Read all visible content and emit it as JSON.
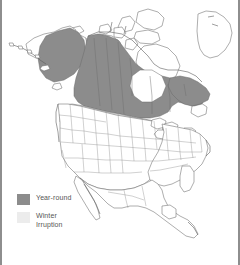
{
  "figure": {
    "type": "range-map",
    "region": "North America",
    "background_color": "#ffffff",
    "border_color": "#8e8e8e"
  },
  "map": {
    "outline_color": "#5a5a5a",
    "internal_border_color": "#6e6e6e",
    "unshaded_fill": "#ffffff",
    "areas": [
      {
        "name": "year-round-range",
        "color": "#8c8c8c",
        "description": "Interior and southern Alaska, Yukon, Northwest Territories, northern Prairie provinces, northern Ontario, Quebec, Labrador and Newfoundland"
      },
      {
        "name": "winter-irruption-range",
        "color": "#e2e2e2",
        "description": "Southern Canadian prairies and the northern tier of the United States"
      }
    ]
  },
  "legend": {
    "items": [
      {
        "label": "Year-round",
        "color": "#8c8c8c",
        "swatch_name": "year-round-swatch"
      },
      {
        "label": "Winter\nIrruption",
        "color": "#ececec",
        "swatch_name": "winter-irruption-swatch"
      }
    ]
  }
}
